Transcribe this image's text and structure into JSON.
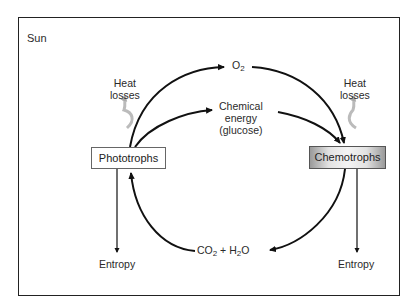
{
  "diagram": {
    "frame_label": "Sun",
    "nodes": {
      "phototrophs": "Phototrophs",
      "chemotrophs": "Chemotrophs"
    },
    "flows": {
      "oxygen": {
        "base": "O",
        "sub": "2"
      },
      "chemical_energy": [
        "Chemical",
        "energy",
        "(glucose)"
      ],
      "co2_h2o": {
        "co": "CO",
        "co_sub": "2",
        "plus": " + H",
        "h_sub": "2",
        "o": "O"
      }
    },
    "heat_losses_left": [
      "Heat",
      "losses"
    ],
    "heat_losses_right": [
      "Heat",
      "losses"
    ],
    "entropy_left": "Entropy",
    "entropy_right": "Entropy",
    "colors": {
      "line": "#111111",
      "heat_arrow": "#b0b0b0",
      "chemo_box_edge": "#9a9a9a"
    }
  }
}
